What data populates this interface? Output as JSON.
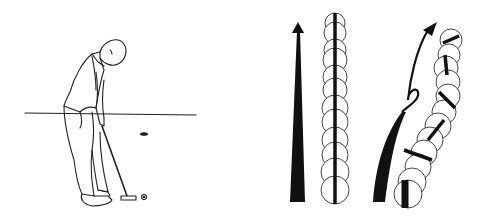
{
  "illustration": {
    "description": "Golf putting illustration: golfer addressing ball, plus two ball-roll diagrams (straight roll vs. curving/skidding roll)",
    "colors": {
      "ink": "#111111",
      "background": "#ffffff"
    },
    "panels": [
      {
        "name": "golfer-putting",
        "label": ""
      },
      {
        "name": "straight-roll-diagram",
        "label": ""
      },
      {
        "name": "curved-roll-diagram",
        "label": ""
      }
    ]
  }
}
